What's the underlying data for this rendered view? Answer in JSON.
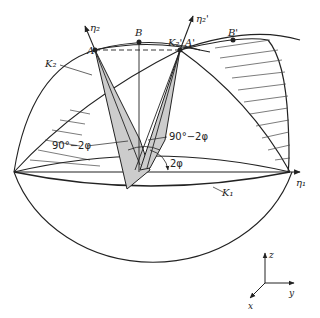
{
  "diagram": {
    "type": "geometric construction - sphere with rotated cones",
    "points": {
      "A": "A",
      "B": "B",
      "A_prime": "A'",
      "B_prime": "B'"
    },
    "axes": {
      "eta1": "η₁",
      "eta2": "η₂",
      "eta2_prime": "η₂'"
    },
    "curves": {
      "K1": "K₁",
      "K2": "K₂",
      "K2_prime": "K₂'"
    },
    "angles": {
      "upper_left": "90°−2φ",
      "upper_right": "90°−2φ",
      "rotation": "2φ"
    },
    "coord_axes": {
      "z": "z",
      "y": "y",
      "x": "x"
    },
    "colors": {
      "stroke": "#222222",
      "shade": "#cccccc",
      "background": "#ffffff"
    }
  }
}
